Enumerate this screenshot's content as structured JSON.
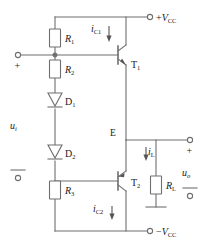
{
  "figure": {
    "wire_color": "#6f6f6f",
    "text_color": "#1a1a1a",
    "background": "#ffffff"
  },
  "supplies": {
    "positive": {
      "sign": "+",
      "symbol": "V",
      "subscript": "CC",
      "full": "+VCC"
    },
    "negative": {
      "sign": "−",
      "symbol": "V",
      "subscript": "CC",
      "full": "−VCC"
    }
  },
  "components": {
    "r1": {
      "symbol": "R",
      "subscript": "1",
      "type": "resistor"
    },
    "r2": {
      "symbol": "R",
      "subscript": "2",
      "type": "resistor"
    },
    "r3": {
      "symbol": "R",
      "subscript": "3",
      "type": "resistor"
    },
    "rl": {
      "symbol": "R",
      "subscript": "L",
      "type": "resistor"
    },
    "d1": {
      "symbol": "D",
      "subscript": "1",
      "type": "diode"
    },
    "d2": {
      "symbol": "D",
      "subscript": "2",
      "type": "diode"
    },
    "t1": {
      "symbol": "T",
      "subscript": "1",
      "type": "npn-transistor"
    },
    "t2": {
      "symbol": "T",
      "subscript": "2",
      "type": "pnp-transistor"
    }
  },
  "currents": {
    "ic1": {
      "symbol": "i",
      "subscript": "C1",
      "direction": "down"
    },
    "ic2": {
      "symbol": "i",
      "subscript": "C2",
      "direction": "down"
    },
    "il": {
      "symbol": "i",
      "subscript": "L",
      "direction": "down"
    }
  },
  "voltages": {
    "ui": {
      "symbol": "u",
      "subscript": "i",
      "plus": "+",
      "minus": "−"
    },
    "uo": {
      "symbol": "u",
      "subscript": "o",
      "plus": "+",
      "minus": "−"
    }
  },
  "nodes": {
    "emitter": {
      "label": "E"
    }
  }
}
